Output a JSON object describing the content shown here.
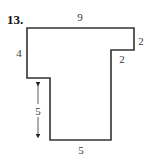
{
  "problem": {
    "number": "13.",
    "dimensions": {
      "top": "9",
      "left_upper": "4",
      "right_notch_height": "2",
      "right_notch_width": "2",
      "left_lower_arrow": "5",
      "bottom": "5"
    }
  },
  "style": {
    "stroke_color": "#333333",
    "text_color": "#3a3a3a"
  }
}
